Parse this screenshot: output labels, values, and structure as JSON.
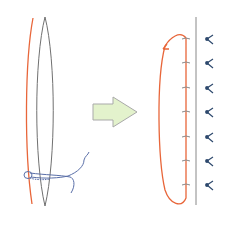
{
  "diagram": {
    "colors": {
      "suture_orange": "#e8663a",
      "lens_gray": "#707070",
      "thread_blue": "#5a6fa8",
      "arrow_fill": "#e3f2cc",
      "arrow_stroke": "#a9a9a9",
      "marker_navy": "#2f4a6e",
      "tick_gray": "#8a8a8a",
      "divider_gray": "#888888"
    },
    "left_panel": {
      "elements": [
        "orange-suture-line",
        "gray-lens-outline",
        "blue-thread-loop"
      ]
    },
    "arrow": {
      "direction": "right",
      "icon": "block-arrow-right"
    },
    "right_panel": {
      "tick_count": 7,
      "marker_count": 7,
      "marker_icon": "y-branch-marker",
      "elements": [
        "orange-running-loop",
        "vertical-divider-line",
        "tick-marks",
        "y-markers"
      ]
    }
  }
}
